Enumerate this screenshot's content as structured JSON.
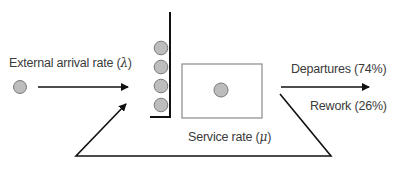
{
  "diagram": {
    "type": "queueing-system-with-rework",
    "labels": {
      "arrival": "External arrival rate (",
      "arrival_symbol": "λ",
      "arrival_close": ")",
      "service": "Service rate (",
      "service_symbol": "μ",
      "service_close": ")",
      "departures": "Departures (74%)",
      "rework": "Rework (26%)"
    },
    "queue_length": 4,
    "colors": {
      "customer_fill": "#bdbdbd",
      "customer_stroke": "#7a7a7a",
      "line": "#111111",
      "box_stroke": "#8a8a8a",
      "text": "#3a3a3a"
    }
  }
}
